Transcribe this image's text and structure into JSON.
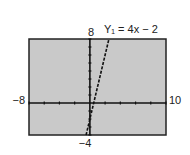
{
  "chart_data": {
    "type": "line",
    "title": "",
    "equation_label": "Y₁ = 4x − 2",
    "series": [
      {
        "name": "Y1 = 4x - 2",
        "slope": 4,
        "intercept": -2,
        "style": "dashed",
        "x": [
          -0.5,
          2.5
        ],
        "y": [
          -4,
          8
        ]
      }
    ],
    "xlim": [
      -8,
      10
    ],
    "ylim": [
      -4,
      8
    ],
    "x_tick_step": 2,
    "y_tick_step": 1,
    "tick_labels": {
      "xmin": "−8",
      "xmax": "10",
      "ymin": "−4",
      "ymax": "8"
    },
    "grid": false,
    "background": "#c8c8c8"
  }
}
